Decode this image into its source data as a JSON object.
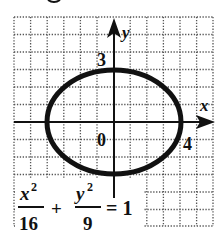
{
  "diagram": {
    "type": "ellipse-graph",
    "equation": {
      "term1_numerator": "x",
      "term1_exponent": "2",
      "term1_denominator": "16",
      "plus": "+",
      "term2_numerator": "y",
      "term2_exponent": "2",
      "term2_denominator": "9",
      "equals": "= 1"
    },
    "axes": {
      "x_label": "x",
      "y_label": "y",
      "origin_label": "0",
      "x_intercept_label": "4",
      "y_intercept_label": "3"
    },
    "ellipse": {
      "a": 4,
      "b": 3,
      "center": [
        0,
        0
      ]
    },
    "grid": {
      "x_range": [
        -6,
        6
      ],
      "y_range": [
        -6,
        6
      ],
      "style": "dotted"
    },
    "colors": {
      "ink": "#111111",
      "grid": "#555555",
      "background": "#ffffff"
    }
  }
}
